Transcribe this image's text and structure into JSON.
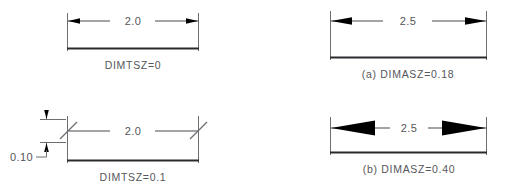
{
  "figure": {
    "background_color": "#ffffff",
    "line_color": "#6d6e72",
    "baseline_color": "#2a2b2e",
    "text_color": "#55565a",
    "arrow_fill_color": "#000000"
  },
  "panels": [
    {
      "id": "top-left",
      "caption": "DIMTSZ=0",
      "dimension_value": "2.0",
      "terminator_type": "arrowhead",
      "terminator_size": "small",
      "vertical_dimension": null,
      "vertical_dimension_value": null
    },
    {
      "id": "top-right",
      "caption": "(a)  DIMASZ=0.18",
      "dimension_value": "2.5",
      "terminator_type": "arrowhead",
      "terminator_size": "medium",
      "vertical_dimension": null,
      "vertical_dimension_value": null
    },
    {
      "id": "bottom-left",
      "caption": "DIMTSZ=0.1",
      "dimension_value": "2.0",
      "terminator_type": "oblique-tick",
      "terminator_size": "tick",
      "vertical_dimension": true,
      "vertical_dimension_value": "0.10"
    },
    {
      "id": "bottom-right",
      "caption": "(b)  DIMASZ=0.40",
      "dimension_value": "2.5",
      "terminator_type": "arrowhead",
      "terminator_size": "large",
      "vertical_dimension": null,
      "vertical_dimension_value": null
    }
  ]
}
